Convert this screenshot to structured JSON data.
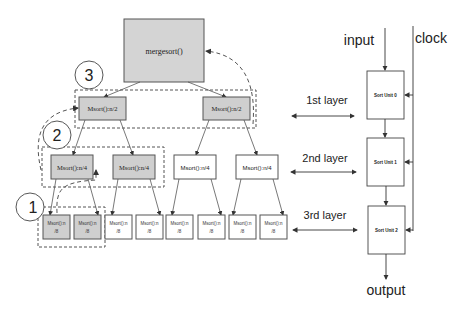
{
  "tree": {
    "root": {
      "label": "mergesort()"
    },
    "layer1": [
      {
        "label": "Msort():n/2",
        "highlighted": true
      },
      {
        "label": "Msort():n/2",
        "highlighted": true
      }
    ],
    "layer2": [
      {
        "label": "Msort():n/4",
        "highlighted": true
      },
      {
        "label": "Msort():n/4",
        "highlighted": true
      },
      {
        "label": "Msort():n/4",
        "highlighted": false
      },
      {
        "label": "Msort():n/4",
        "highlighted": false
      }
    ],
    "layer3": [
      {
        "line1": "Msort():n",
        "line2": "/8",
        "highlighted": true
      },
      {
        "line1": "Msort():n",
        "line2": "/8",
        "highlighted": true
      },
      {
        "line1": "Msort():n",
        "line2": "/8",
        "highlighted": false
      },
      {
        "line1": "Msort():n",
        "line2": "/8",
        "highlighted": false
      },
      {
        "line1": "Msort():n",
        "line2": "/8",
        "highlighted": false
      },
      {
        "line1": "Msort():n",
        "line2": "/8",
        "highlighted": false
      },
      {
        "line1": "Msort():n",
        "line2": "/8",
        "highlighted": false
      },
      {
        "line1": "Msort():n",
        "line2": "/8",
        "highlighted": false
      }
    ],
    "step_circles": [
      "3",
      "2",
      "1"
    ]
  },
  "layers": {
    "first": "1st layer",
    "second": "2nd layer",
    "third": "3rd layer"
  },
  "pipeline": {
    "input": "input",
    "clock": "clock",
    "output": "output",
    "units": [
      "Sort Unit 0",
      "Sort Unit 1",
      "Sort Unit 2"
    ]
  },
  "colors": {
    "highlight_fill": "#cfcfcf",
    "root_fill": "#d4d4d4",
    "stroke": "#555555",
    "dashed": "#555555"
  }
}
